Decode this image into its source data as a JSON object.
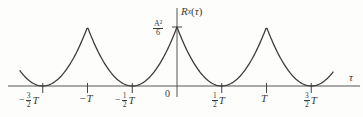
{
  "figure": {
    "y_axis_label": {
      "r": "R",
      "sub": "x",
      "open": "(",
      "tau": "τ",
      "close": ")"
    },
    "peak_label": {
      "num": "A²",
      "den": "6"
    },
    "origin_label": "0",
    "x_axis_label": "τ",
    "x_tick_labels": [
      {
        "minus": "−",
        "num": "3",
        "den": "2",
        "suffix": "T"
      },
      {
        "text": "−T"
      },
      {
        "minus": "−",
        "num": "1",
        "den": "2",
        "suffix": "T"
      },
      {
        "num": "1",
        "den": "2",
        "suffix": "T"
      },
      {
        "text": "T"
      },
      {
        "num": "3",
        "den": "2",
        "suffix": "T"
      }
    ]
  },
  "chart_data": {
    "type": "line",
    "ylabel": "R_x(τ)",
    "xlabel": "τ",
    "function": "R_x(τ) = (A²/6)·(1 − 2·|τ/T − round(τ/T)|)², periodic with period T",
    "period": "T",
    "peak_value": "A²/6",
    "peaks_at": [
      "−T",
      "0",
      "T"
    ],
    "zeros_at": [
      "−3T/2",
      "−T/2",
      "T/2",
      "3T/2"
    ],
    "x_ticks": [
      "−3/2 T",
      "−T",
      "−1/2 T",
      "0",
      "1/2 T",
      "T",
      "3/2 T"
    ],
    "x_range_shown": [
      "−1.76T",
      "1.74T"
    ],
    "y_range": [
      0,
      "A²/6"
    ],
    "grid": false,
    "legend": false,
    "stroke_color": "#3c3c3c",
    "sample_points_tau_over_T": [
      -1.5,
      -1.25,
      -1.0,
      -0.75,
      -0.5,
      -0.25,
      0,
      0.25,
      0.5,
      0.75,
      1.0,
      1.25,
      1.5
    ],
    "sample_values_times_6_over_A2": [
      0,
      0.25,
      1,
      0.25,
      0,
      0.25,
      1,
      0.25,
      0,
      0.25,
      1,
      0.25,
      0
    ]
  }
}
